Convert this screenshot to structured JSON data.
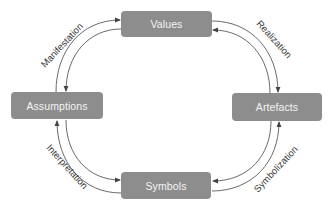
{
  "diagram": {
    "type": "cycle",
    "nodes": [
      {
        "id": "values",
        "label": "Values"
      },
      {
        "id": "artefacts",
        "label": "Artefacts"
      },
      {
        "id": "symbols",
        "label": "Symbols"
      },
      {
        "id": "assumptions",
        "label": "Assumptions"
      }
    ],
    "edges": [
      {
        "label": "Realization",
        "from": "values",
        "to": "artefacts",
        "bidirectional": true
      },
      {
        "label": "Symbolization",
        "from": "artefacts",
        "to": "symbols",
        "bidirectional": true
      },
      {
        "label": "Interpretation",
        "from": "symbols",
        "to": "assumptions",
        "bidirectional": true
      },
      {
        "label": "Manifestation",
        "from": "assumptions",
        "to": "values",
        "bidirectional": true
      }
    ],
    "colors": {
      "node_fill": "#8d8d8d",
      "node_text": "#f4f4f4",
      "arrow": "#444444",
      "label_text": "#3a3a3a"
    }
  }
}
